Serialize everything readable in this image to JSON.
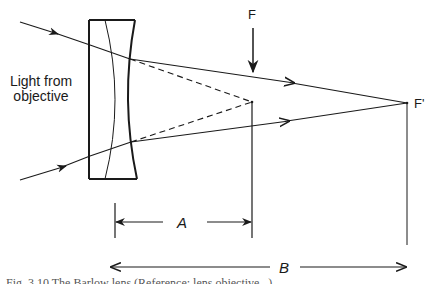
{
  "diagram": {
    "type": "optics-ray-diagram",
    "labels": {
      "source": "Light from\nobjective",
      "source_line1": "Light from",
      "source_line2": "objective",
      "focus": "F",
      "new_focus": "F'",
      "dimension_a": "A",
      "dimension_b": "B"
    },
    "elements": {
      "lens": {
        "kind": "negative achromatic doublet",
        "x_range": [
          89,
          137
        ],
        "y_range": [
          20,
          179
        ]
      },
      "rays": [
        {
          "name": "upper-ray",
          "from": [
            20,
            22
          ],
          "lens_entry": [
            90,
            45
          ],
          "lens_exit": [
            130,
            59
          ],
          "to": [
            407,
            103
          ]
        },
        {
          "name": "lower-ray",
          "from": [
            20,
            180
          ],
          "lens_entry": [
            90,
            156
          ],
          "lens_exit": [
            131,
            142
          ],
          "to": [
            407,
            103
          ]
        }
      ],
      "virtual_rays": [
        {
          "name": "upper-dashed",
          "from": [
            130,
            59
          ],
          "to": [
            252,
            102
          ]
        },
        {
          "name": "lower-dashed",
          "from": [
            131,
            142
          ],
          "to": [
            252,
            102
          ]
        }
      ],
      "points": {
        "F": [
          252,
          102
        ],
        "F_prime": [
          407,
          103
        ]
      },
      "dimensions": {
        "A": {
          "from_x": 115,
          "to_x": 252,
          "y": 222
        },
        "B": {
          "from_x": 110,
          "to_x": 407,
          "y": 267
        }
      }
    },
    "colors": {
      "stroke": "#1a1a1a",
      "background": "#ffffff"
    }
  },
  "caption": {
    "text": "Fig. 3.10 The Barlow lens (Reference: lens objective...) ...",
    "clipped": true
  }
}
